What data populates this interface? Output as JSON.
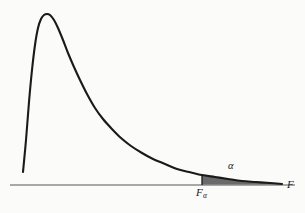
{
  "figure": {
    "background_color": "#fbfbfa",
    "curve_color": "#1a1a1a",
    "axis_color": "#8c8c8c",
    "shade_color": "#6a6a6a",
    "label_color": "#1a1a1a"
  },
  "labels": {
    "critical_value_symbol": "F",
    "critical_value_subscript": "α",
    "tail_area_symbol": "α",
    "axis_symbol": "F"
  },
  "chart_data": {
    "type": "area",
    "xlabel": "F",
    "ylabel": "",
    "grid": false,
    "legend": null,
    "xlim": [
      10,
      295
    ],
    "ylim": [
      185,
      8
    ],
    "axis": {
      "name": "horizontal-axis",
      "x_start": 10,
      "x_end": 295,
      "y": 185,
      "label": "F",
      "label_x": 289,
      "label_y": 185,
      "tick_labels": [
        "Fα"
      ],
      "ticks": [
        202
      ]
    },
    "series": [
      {
        "name": "F density curve",
        "x": [
          23,
          26,
          29,
          32,
          35,
          38,
          41,
          44,
          47,
          50,
          54,
          58,
          63,
          68,
          74,
          80,
          87,
          95,
          103,
          112,
          121,
          131,
          142,
          153,
          165,
          177,
          189,
          202,
          215,
          228,
          242,
          256,
          270,
          282
        ],
        "y": [
          172,
          140,
          102,
          70,
          45,
          28,
          19,
          15,
          14,
          15,
          20,
          28,
          40,
          53,
          67,
          80,
          94,
          108,
          119,
          129,
          138,
          146,
          153,
          159,
          164,
          169,
          172,
          175,
          177,
          179,
          181,
          182,
          183,
          184
        ]
      }
    ],
    "shaded_region": {
      "name": "alpha-tail-region",
      "label": "α",
      "label_x": 232,
      "label_y": 167,
      "x_from": 202,
      "x_to": 282,
      "baseline_y": 185,
      "fill": "#6a6a6a",
      "description": "upper tail area of size alpha to the right of F-alpha"
    },
    "annotations": [
      {
        "text": "Fα",
        "x": 203,
        "y": 193,
        "role": "critical-value-label"
      },
      {
        "text": "α",
        "x": 232,
        "y": 167,
        "role": "tail-area-label"
      },
      {
        "text": "F",
        "x": 289,
        "y": 185,
        "role": "axis-label"
      }
    ]
  }
}
